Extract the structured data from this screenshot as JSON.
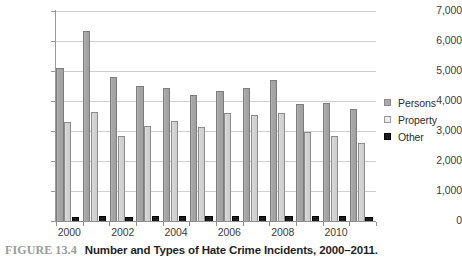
{
  "chart_data": {
    "type": "bar",
    "title": "",
    "xlabel": "",
    "ylabel": "",
    "ylim": [
      0,
      7000
    ],
    "ytick_step": 1000,
    "grid": true,
    "legend_position": "right",
    "categories": [
      "2000",
      "2001",
      "2002",
      "2003",
      "2004",
      "2005",
      "2006",
      "2007",
      "2008",
      "2009",
      "2010",
      "2011"
    ],
    "visible_tick_labels": [
      "2000",
      "2002",
      "2004",
      "2006",
      "2008",
      "2010"
    ],
    "ytick_labels": [
      "0",
      "1,000",
      "2,000",
      "3,000",
      "4,000",
      "5,000",
      "6,000",
      "7,000"
    ],
    "series": [
      {
        "name": "Persons",
        "color": "#a8a8a8",
        "values": [
          5100,
          6350,
          4800,
          4500,
          4450,
          4200,
          4350,
          4450,
          4700,
          3900,
          3950,
          3750
        ]
      },
      {
        "name": "Property",
        "color": "#d6d6d6",
        "values": [
          3300,
          3650,
          2830,
          3180,
          3350,
          3150,
          3600,
          3550,
          3600,
          2960,
          2840,
          2600
        ]
      },
      {
        "name": "Other",
        "color": "#1c1c1c",
        "values": [
          130,
          160,
          140,
          160,
          170,
          180,
          180,
          170,
          180,
          170,
          160,
          150
        ]
      }
    ]
  },
  "legend": {
    "items": [
      {
        "label": "Persons",
        "key": "persons"
      },
      {
        "label": "Property",
        "key": "property"
      },
      {
        "label": "Other",
        "key": "other"
      }
    ]
  },
  "caption": {
    "figure_number": "FIGURE 13.4",
    "text": "Number and Types of Hate Crime Incidents, 2000–2011."
  }
}
